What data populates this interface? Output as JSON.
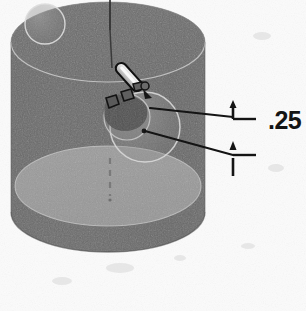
{
  "figure": {
    "background_color": "#fdfdfd"
  },
  "annotations": {
    "dimension_value": ".25",
    "dimension_x": 268,
    "dimension_y": 108
  },
  "colors": {
    "top_face": "#6f6f6f",
    "top_face_dark": "#636363",
    "side_wall": "#6a6a6a",
    "side_wall_shadow": "#5c5c5c",
    "bottom_face": "#9b9b9b",
    "bottom_face_edge": "#8d8d8d",
    "outline_light": "#c9c9c9",
    "sphere_fill": "#8e8e8e",
    "sphere_outline": "#d5d5d5",
    "line_dark": "#1c1c1c",
    "tool_body": "#e8e8e8",
    "tool_outline": "#111111",
    "chip_fill": "#555555",
    "background": "#fdfdfd"
  },
  "geometry": {
    "cylinder": {
      "center_x": 108,
      "top_ellipse_cy": 42,
      "bottom_ellipse_cy": 212,
      "rx": 97,
      "ry": 40
    },
    "axis_line": {
      "x": 110,
      "y_top": 0,
      "y_bottom": 68
    },
    "center_dashed_axis": {
      "x": 110,
      "y_top": 158,
      "y_bottom": 196
    },
    "tool": {
      "x1": 116,
      "y1": 62,
      "x2": 142,
      "y2": 92,
      "width": 9
    },
    "top_left_sphere": {
      "cx": 45,
      "cy": 24,
      "r": 20
    },
    "center_sphere_large": {
      "cx": 145,
      "cy": 127,
      "r": 35
    },
    "center_sphere_small": {
      "cx": 128,
      "cy": 118,
      "r": 23
    },
    "leader_upper": {
      "x1": 148,
      "y1": 108,
      "x2": 232,
      "y2": 117
    },
    "leader_lower": {
      "x1": 143,
      "y1": 131,
      "x2": 232,
      "y2": 155
    },
    "arrow_upper": {
      "x": 232,
      "y_tip": 103,
      "y_tail": 119
    },
    "arrow_lower": {
      "x": 232,
      "y_tip": 142,
      "y_tail": 172
    }
  },
  "icons": {
    "arrow_up": "arrow-up-icon",
    "leader": "leader-line-icon"
  }
}
